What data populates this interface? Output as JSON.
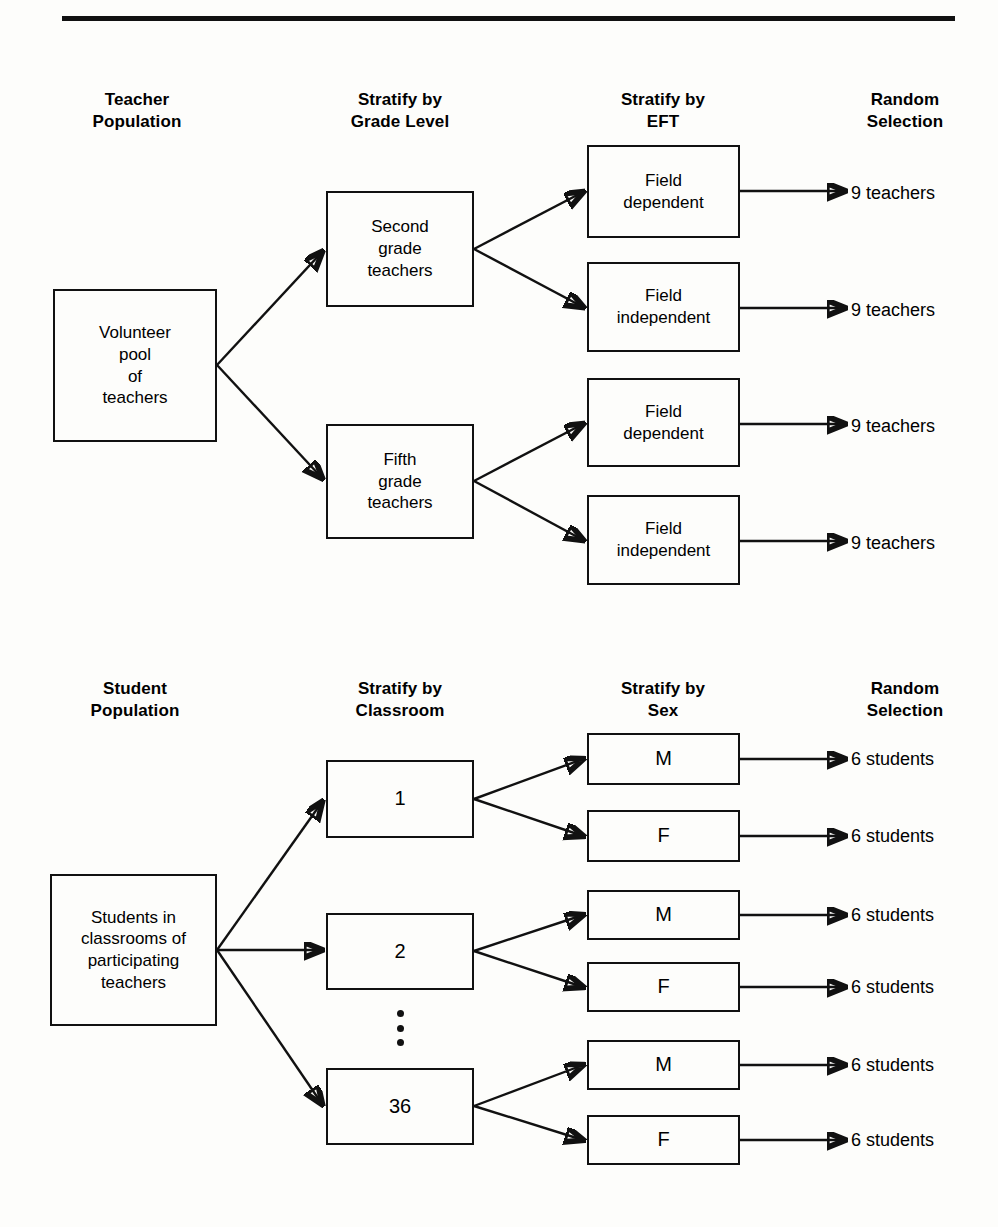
{
  "figure": {
    "divider_color": "#111111"
  },
  "teacher_diagram": {
    "headers": [
      {
        "label": "Teacher\nPopulation"
      },
      {
        "label": "Stratify by\nGrade Level"
      },
      {
        "label": "Stratify by\nEFT"
      },
      {
        "label": "Random\nSelection"
      }
    ],
    "population": {
      "label": "Volunteer\npool\nof\nteachers"
    },
    "strata": [
      {
        "label": "Second\ngrade\nteachers"
      },
      {
        "label": "Fifth\ngrade\nteachers"
      }
    ],
    "eft_groups": [
      {
        "label": "Field\ndependent"
      },
      {
        "label": "Field\nindependent"
      },
      {
        "label": "Field\ndependent"
      },
      {
        "label": "Field\nindependent"
      }
    ],
    "selections": [
      {
        "label": "9 teachers"
      },
      {
        "label": "9 teachers"
      },
      {
        "label": "9 teachers"
      },
      {
        "label": "9 teachers"
      }
    ]
  },
  "student_diagram": {
    "headers": [
      {
        "label": "Student\nPopulation"
      },
      {
        "label": "Stratify by\nClassroom"
      },
      {
        "label": "Stratify by\nSex"
      },
      {
        "label": "Random\nSelection"
      }
    ],
    "population": {
      "label": "Students in\nclassrooms of\nparticipating\nteachers"
    },
    "classrooms": [
      {
        "label": "1"
      },
      {
        "label": "2"
      },
      {
        "label": "36"
      }
    ],
    "ellipsis": {
      "label": "vertical-ellipsis"
    },
    "sex_groups": [
      {
        "label": "M"
      },
      {
        "label": "F"
      },
      {
        "label": "M"
      },
      {
        "label": "F"
      },
      {
        "label": "M"
      },
      {
        "label": "F"
      }
    ],
    "selections": [
      {
        "label": "6 students"
      },
      {
        "label": "6 students"
      },
      {
        "label": "6 students"
      },
      {
        "label": "6 students"
      },
      {
        "label": "6 students"
      },
      {
        "label": "6 students"
      }
    ]
  }
}
